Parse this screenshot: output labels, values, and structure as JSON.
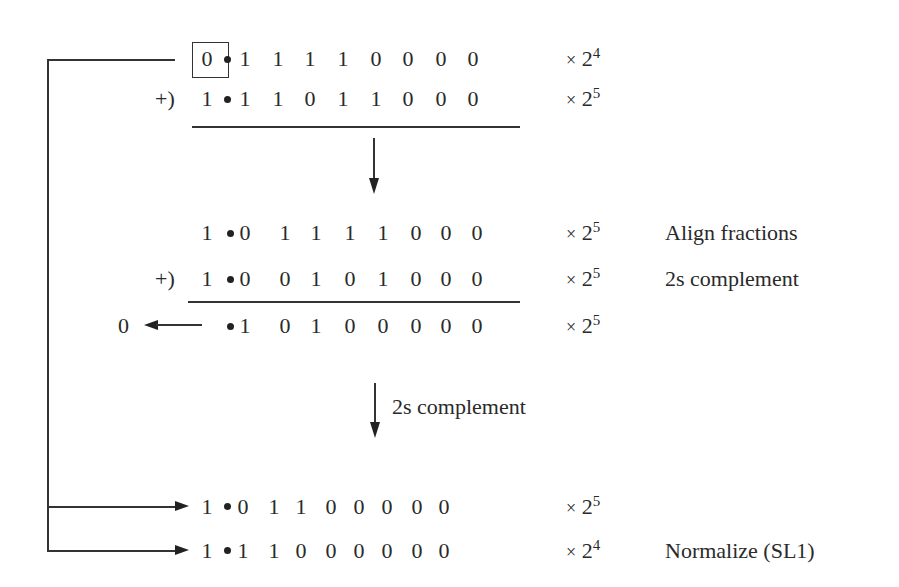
{
  "diagram": {
    "rows": [
      {
        "id": "op1",
        "prefix": "",
        "bits": [
          "0",
          "1",
          "1",
          "1",
          "1",
          "0",
          "0",
          "0",
          "0"
        ],
        "exponent": "4",
        "note": "",
        "boxed_first": true
      },
      {
        "id": "op2",
        "prefix": "+)",
        "bits": [
          "1",
          "1",
          "1",
          "0",
          "1",
          "1",
          "0",
          "0",
          "0"
        ],
        "exponent": "5",
        "note": ""
      },
      {
        "id": "aligned",
        "prefix": "",
        "bits": [
          "1",
          "0",
          "1",
          "1",
          "1",
          "1",
          "0",
          "0",
          "0"
        ],
        "exponent": "5",
        "note": "Align fractions"
      },
      {
        "id": "complement",
        "prefix": "+)",
        "bits": [
          "1",
          "0",
          "0",
          "1",
          "0",
          "1",
          "0",
          "0",
          "0"
        ],
        "exponent": "5",
        "note": "2s complement"
      },
      {
        "id": "sum",
        "prefix": "",
        "carry": "0",
        "bits": [
          "",
          "1",
          "0",
          "1",
          "0",
          "0",
          "0",
          "0",
          "0"
        ],
        "exponent": "5",
        "note": ""
      },
      {
        "id": "result",
        "prefix": "",
        "bits": [
          "1",
          "0",
          "1",
          "1",
          "0",
          "0",
          "0",
          "0",
          "0"
        ],
        "exponent": "5",
        "note": ""
      },
      {
        "id": "normalized",
        "prefix": "",
        "bits": [
          "1",
          "1",
          "1",
          "0",
          "0",
          "0",
          "0",
          "0",
          "0"
        ],
        "exponent": "4",
        "note": "Normalize (SL1)"
      }
    ],
    "multiply_symbol": "×",
    "base": "2",
    "step_label": "2s complement"
  }
}
